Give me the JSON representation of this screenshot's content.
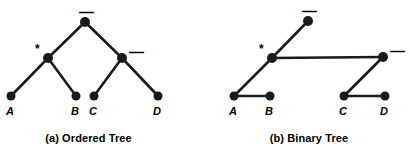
{
  "figure": {
    "background": "#ffffff",
    "stroke_color": "#1a1a1a",
    "node_color": "#1a1a1a"
  },
  "panels": [
    {
      "id": "ordered-tree",
      "caption": "(a) Ordered Tree",
      "nodes": [
        {
          "key": "root",
          "op": "—",
          "x": 85,
          "y": 22,
          "r": 5
        },
        {
          "key": "times",
          "op": "*",
          "x": 48,
          "y": 58,
          "r": 5
        },
        {
          "key": "minus",
          "op": "—",
          "x": 122,
          "y": 58,
          "r": 5
        },
        {
          "key": "a",
          "op": "",
          "x": 11,
          "y": 96,
          "r": 4.5
        },
        {
          "key": "b",
          "op": "",
          "x": 76,
          "y": 96,
          "r": 4.5
        },
        {
          "key": "c",
          "op": "",
          "x": 94,
          "y": 96,
          "r": 4.5
        },
        {
          "key": "d",
          "op": "",
          "x": 158,
          "y": 96,
          "r": 4.5
        }
      ],
      "leaf_labels": [
        {
          "text": "A",
          "x": 6,
          "y": 105
        },
        {
          "text": "B",
          "x": 71,
          "y": 105
        },
        {
          "text": "C",
          "x": 89,
          "y": 105
        },
        {
          "text": "D",
          "x": 153,
          "y": 105
        }
      ],
      "op_labels": [
        {
          "text": "—",
          "x": 79,
          "y": 4,
          "kind": "minus"
        },
        {
          "text": "*",
          "x": 35,
          "y": 43,
          "kind": "star"
        },
        {
          "text": "—",
          "x": 129,
          "y": 44,
          "kind": "minus"
        }
      ],
      "edges": [
        {
          "from": "root",
          "to": "times"
        },
        {
          "from": "root",
          "to": "minus"
        },
        {
          "from": "times",
          "to": "a"
        },
        {
          "from": "times",
          "to": "b"
        },
        {
          "from": "minus",
          "to": "c"
        },
        {
          "from": "minus",
          "to": "d"
        }
      ]
    },
    {
      "id": "binary-tree",
      "caption": "(b) Binary Tree",
      "nodes": [
        {
          "key": "root",
          "op": "—",
          "x": 107,
          "y": 21,
          "r": 5
        },
        {
          "key": "times",
          "op": "*",
          "x": 71,
          "y": 58,
          "r": 5
        },
        {
          "key": "minus",
          "op": "—",
          "x": 182,
          "y": 57,
          "r": 5
        },
        {
          "key": "a",
          "op": "",
          "x": 33,
          "y": 96,
          "r": 4.5
        },
        {
          "key": "b",
          "op": "",
          "x": 69,
          "y": 96,
          "r": 4.5
        },
        {
          "key": "c",
          "op": "",
          "x": 143,
          "y": 96,
          "r": 4.5
        },
        {
          "key": "d",
          "op": "",
          "x": 184,
          "y": 96,
          "r": 4.5
        }
      ],
      "leaf_labels": [
        {
          "text": "A",
          "x": 28,
          "y": 105
        },
        {
          "text": "B",
          "x": 64,
          "y": 105
        },
        {
          "text": "C",
          "x": 138,
          "y": 105
        },
        {
          "text": "D",
          "x": 179,
          "y": 105
        }
      ],
      "op_labels": [
        {
          "text": "—",
          "x": 101,
          "y": 3,
          "kind": "minus"
        },
        {
          "text": "*",
          "x": 58,
          "y": 43,
          "kind": "star"
        },
        {
          "text": "—",
          "x": 189,
          "y": 43,
          "kind": "minus"
        }
      ],
      "edges": [
        {
          "from": "root",
          "to": "times"
        },
        {
          "from": "times",
          "to": "a"
        },
        {
          "from": "times",
          "to": "minus"
        },
        {
          "from": "a",
          "to": "b"
        },
        {
          "from": "minus",
          "to": "c"
        },
        {
          "from": "c",
          "to": "d"
        }
      ]
    }
  ]
}
